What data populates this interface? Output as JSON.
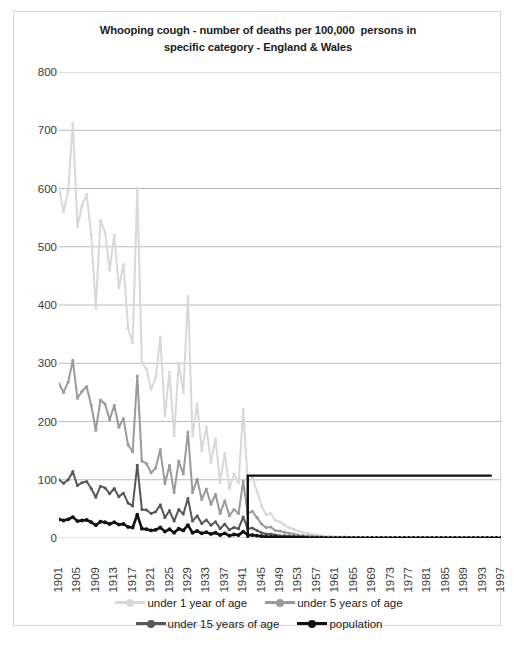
{
  "chart_data": {
    "type": "line",
    "title": "Whooping cough - number of deaths per 100,000  persons in\nspecific category - England & Wales",
    "xlabel": "",
    "ylabel": "",
    "ylim": [
      0,
      800
    ],
    "ytick_values": [
      0,
      100,
      200,
      300,
      400,
      500,
      600,
      700,
      800
    ],
    "ytick_labels": [
      "0",
      "100",
      "200",
      "300",
      "400",
      "500",
      "600",
      "700",
      "800"
    ],
    "grid": true,
    "legend_position": "bottom",
    "xlim": [
      1901,
      1997
    ],
    "x_tick_step": 4,
    "xtick_labels": [
      "1901",
      "1905",
      "1909",
      "1913",
      "1917",
      "1921",
      "1925",
      "1929",
      "1933",
      "1937",
      "1941",
      "1945",
      "1949",
      "1953",
      "1957",
      "1961",
      "1965",
      "1969",
      "1973",
      "1977",
      "1981",
      "1985",
      "1989",
      "1993",
      "1997"
    ],
    "x": [
      1901,
      1902,
      1903,
      1904,
      1905,
      1906,
      1907,
      1908,
      1909,
      1910,
      1911,
      1912,
      1913,
      1914,
      1915,
      1916,
      1917,
      1918,
      1919,
      1920,
      1921,
      1922,
      1923,
      1924,
      1925,
      1926,
      1927,
      1928,
      1929,
      1930,
      1931,
      1932,
      1933,
      1934,
      1935,
      1936,
      1937,
      1938,
      1939,
      1940,
      1941,
      1942,
      1943,
      1944,
      1945,
      1946,
      1947,
      1948,
      1949,
      1950,
      1951,
      1952,
      1953,
      1954,
      1955,
      1956,
      1957,
      1958,
      1959,
      1960,
      1961,
      1962,
      1963,
      1964,
      1965,
      1966,
      1967,
      1968,
      1969,
      1970,
      1971,
      1972,
      1973,
      1974,
      1975,
      1976,
      1977,
      1978,
      1979,
      1980,
      1981,
      1982,
      1983,
      1984,
      1985,
      1986,
      1987,
      1988,
      1989,
      1990,
      1991,
      1992,
      1993,
      1994,
      1995,
      1996,
      1997
    ],
    "series": [
      {
        "name": "under 1 year of age",
        "color": "#d8d8d8",
        "values": [
          600,
          560,
          597,
          712,
          535,
          570,
          590,
          520,
          395,
          545,
          525,
          460,
          520,
          430,
          470,
          360,
          335,
          600,
          300,
          290,
          255,
          275,
          345,
          210,
          285,
          175,
          300,
          250,
          415,
          175,
          230,
          150,
          190,
          130,
          170,
          95,
          145,
          85,
          110,
          95,
          220,
          95,
          105,
          80,
          55,
          40,
          42,
          30,
          28,
          22,
          18,
          15,
          12,
          10,
          8,
          6,
          5,
          4,
          3,
          3,
          2,
          2,
          2,
          1,
          1,
          1,
          1,
          1,
          1,
          1,
          1,
          1,
          1,
          1,
          1,
          1,
          1,
          1,
          1,
          1,
          1,
          1,
          1,
          1,
          1,
          1,
          1,
          1,
          1,
          1,
          1,
          1,
          1,
          1,
          1,
          1,
          1
        ]
      },
      {
        "name": "under 5 years of age",
        "color": "#9a9a9a",
        "values": [
          265,
          250,
          268,
          305,
          240,
          252,
          260,
          228,
          185,
          237,
          230,
          203,
          228,
          190,
          205,
          160,
          148,
          278,
          132,
          128,
          112,
          120,
          152,
          93,
          125,
          78,
          132,
          110,
          182,
          78,
          101,
          66,
          84,
          58,
          75,
          42,
          64,
          38,
          49,
          42,
          97,
          42,
          46,
          35,
          24,
          18,
          19,
          13,
          12,
          10,
          8,
          7,
          5,
          4,
          4,
          3,
          2,
          2,
          1,
          1,
          1,
          1,
          1,
          1,
          0,
          0,
          0,
          0,
          0,
          0,
          0,
          0,
          0,
          0,
          0,
          0,
          0,
          0,
          0,
          0,
          0,
          0,
          0,
          0,
          0,
          0,
          0,
          0,
          0,
          0,
          0,
          0,
          0,
          0,
          0,
          0,
          0
        ]
      },
      {
        "name": "under 15 years of age",
        "color": "#575757",
        "values": [
          100,
          94,
          100,
          114,
          90,
          95,
          97,
          85,
          70,
          89,
          86,
          76,
          85,
          71,
          77,
          60,
          55,
          125,
          49,
          48,
          42,
          45,
          57,
          35,
          47,
          29,
          49,
          41,
          68,
          29,
          38,
          25,
          31,
          22,
          28,
          16,
          24,
          14,
          18,
          16,
          36,
          16,
          17,
          13,
          9,
          7,
          7,
          5,
          4,
          4,
          3,
          3,
          2,
          2,
          1,
          1,
          1,
          1,
          0,
          0,
          0,
          0,
          0,
          0,
          0,
          0,
          0,
          0,
          0,
          0,
          0,
          0,
          0,
          0,
          0,
          0,
          0,
          0,
          0,
          0,
          0,
          0,
          0,
          0,
          0,
          0,
          0,
          0,
          0,
          0,
          0,
          0,
          0,
          0,
          0,
          0,
          0
        ]
      },
      {
        "name": "population",
        "color": "#111111",
        "values": [
          32,
          30,
          32,
          36,
          29,
          30,
          31,
          27,
          22,
          28,
          27,
          24,
          27,
          23,
          24,
          19,
          18,
          40,
          16,
          15,
          13,
          14,
          18,
          11,
          15,
          9,
          16,
          13,
          22,
          9,
          12,
          8,
          10,
          7,
          9,
          5,
          8,
          4,
          6,
          5,
          11,
          5,
          5,
          4,
          3,
          2,
          2,
          2,
          1,
          1,
          1,
          1,
          1,
          1,
          0,
          0,
          0,
          0,
          0,
          0,
          0,
          0,
          0,
          0,
          0,
          0,
          0,
          0,
          0,
          0,
          0,
          0,
          0,
          0,
          0,
          0,
          0,
          0,
          0,
          0,
          0,
          0,
          0,
          0,
          0,
          0,
          0,
          0,
          0,
          0,
          0,
          0,
          0,
          0,
          0,
          0,
          0
        ]
      }
    ],
    "annotations": [
      {
        "name": "vaccination-era-marker",
        "type": "step-line",
        "color": "#111111",
        "start_x": 1942,
        "end_x": 1995,
        "value": 107,
        "description": "black step line rising at 1942 to about 107 and running flat to 1995"
      }
    ]
  },
  "legend": {
    "rows": [
      [
        {
          "label": "under 1 year of age",
          "color": "#d8d8d8",
          "marker": true
        },
        {
          "label": "under 5 years of age",
          "color": "#9a9a9a",
          "marker": true
        }
      ],
      [
        {
          "label": "under 15 years of age",
          "color": "#575757",
          "marker": true
        },
        {
          "label": "population",
          "color": "#111111",
          "marker": true
        }
      ]
    ]
  },
  "colors": {
    "background": "#ffffff",
    "border": "#d8d8d8",
    "gridline": "#a9a9a9",
    "text": "#3a3a3a",
    "title": "#1b1b1b"
  }
}
